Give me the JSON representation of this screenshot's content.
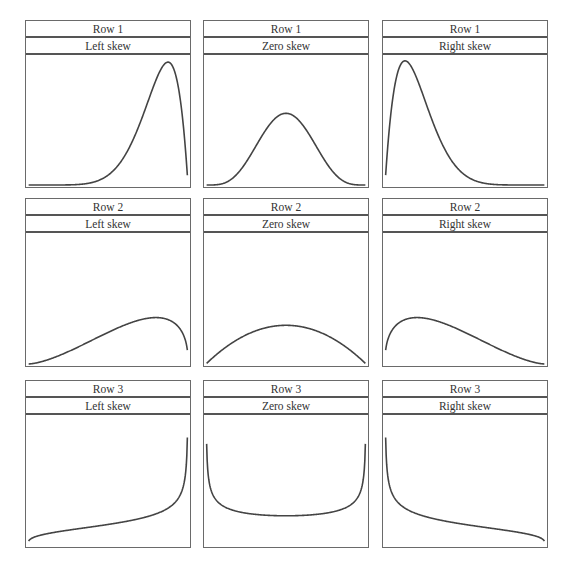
{
  "chart_data": [
    {
      "type": "line",
      "row_label": "Row 1",
      "skew_label": "Left skew",
      "distribution": "beta",
      "params": {
        "a": 8,
        "b": 2
      },
      "peak_fraction": 0.96,
      "x_range": [
        0,
        1
      ]
    },
    {
      "type": "line",
      "row_label": "Row 1",
      "skew_label": "Zero skew",
      "distribution": "beta",
      "params": {
        "a": 5,
        "b": 5
      },
      "peak_fraction": 0.56,
      "x_range": [
        0,
        1
      ]
    },
    {
      "type": "line",
      "row_label": "Row 1",
      "skew_label": "Right skew",
      "distribution": "beta",
      "params": {
        "a": 2,
        "b": 8
      },
      "peak_fraction": 0.97,
      "x_range": [
        0,
        1
      ]
    },
    {
      "type": "line",
      "row_label": "Row 2",
      "skew_label": "Left skew",
      "distribution": "beta",
      "params": {
        "a": 2.6,
        "b": 1.4
      },
      "peak_fraction": 0.36,
      "x_range": [
        0,
        1
      ]
    },
    {
      "type": "line",
      "row_label": "Row 2",
      "skew_label": "Zero skew",
      "distribution": "beta",
      "params": {
        "a": 2,
        "b": 2
      },
      "peak_fraction": 0.3,
      "x_range": [
        0,
        1
      ]
    },
    {
      "type": "line",
      "row_label": "Row 2",
      "skew_label": "Right skew",
      "distribution": "beta",
      "params": {
        "a": 1.4,
        "b": 2.6
      },
      "peak_fraction": 0.36,
      "x_range": [
        0,
        1
      ]
    },
    {
      "type": "line",
      "row_label": "Row 3",
      "skew_label": "Left skew",
      "distribution": "beta",
      "params": {
        "a": 1.3,
        "b": 0.7
      },
      "peak_fraction": 0.84,
      "x_range": [
        0,
        1
      ]
    },
    {
      "type": "line",
      "row_label": "Row 3",
      "skew_label": "Zero skew",
      "distribution": "beta",
      "params": {
        "a": 0.7,
        "b": 0.7
      },
      "peak_fraction": 0.79,
      "x_range": [
        0,
        1
      ]
    },
    {
      "type": "line",
      "row_label": "Row 3",
      "skew_label": "Right skew",
      "distribution": "beta",
      "params": {
        "a": 0.7,
        "b": 1.3
      },
      "peak_fraction": 0.84,
      "x_range": [
        0,
        1
      ]
    }
  ]
}
